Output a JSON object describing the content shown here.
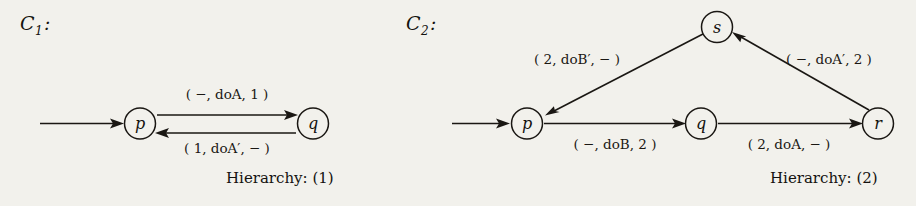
{
  "figure": {
    "background_color": "#f2f1ec",
    "ink_color": "#1a1713",
    "systems": [
      {
        "id": "C1",
        "label_base": "C",
        "label_sub": "1",
        "label_colon": " :",
        "caption": "Hierarchy: (1)",
        "nodes": [
          {
            "id": "p",
            "label": "p"
          },
          {
            "id": "q",
            "label": "q"
          }
        ],
        "edges": [
          {
            "id": "initial-arrow-p",
            "from": "",
            "to": "p",
            "label": ""
          },
          {
            "id": "p-to-q",
            "from": "p",
            "to": "q",
            "label": "( −, doA, 1 )",
            "parts": {
              "guard": "−",
              "action": "doA",
              "effect": "1"
            }
          },
          {
            "id": "q-to-p",
            "from": "q",
            "to": "p",
            "label": "( 1, doA′, − )",
            "parts": {
              "guard": "1",
              "action": "doA′",
              "effect": "−"
            }
          }
        ]
      },
      {
        "id": "C2",
        "label_base": "C",
        "label_sub": "2",
        "label_colon": " :",
        "caption": "Hierarchy: (2)",
        "nodes": [
          {
            "id": "p",
            "label": "p"
          },
          {
            "id": "q",
            "label": "q"
          },
          {
            "id": "r",
            "label": "r"
          },
          {
            "id": "s",
            "label": "s"
          }
        ],
        "edges": [
          {
            "id": "initial-arrow-p",
            "from": "",
            "to": "p",
            "label": ""
          },
          {
            "id": "s-to-p",
            "from": "s",
            "to": "p",
            "label": "( 2, doB′, − )",
            "parts": {
              "guard": "2",
              "action": "doB′",
              "effect": "−"
            }
          },
          {
            "id": "r-to-s",
            "from": "r",
            "to": "s",
            "label": "( −, doA′, 2 )",
            "parts": {
              "guard": "−",
              "action": "doA′",
              "effect": "2"
            }
          },
          {
            "id": "p-to-q",
            "from": "p",
            "to": "q",
            "label": "( −, doB, 2 )",
            "parts": {
              "guard": "−",
              "action": "doB",
              "effect": "2"
            }
          },
          {
            "id": "q-to-r",
            "from": "q",
            "to": "r",
            "label": "( 2, doA, − )",
            "parts": {
              "guard": "2",
              "action": "doA",
              "effect": "−"
            }
          }
        ]
      }
    ]
  }
}
